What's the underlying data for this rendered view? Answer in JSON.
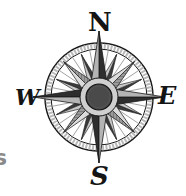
{
  "image": {
    "subject": "compass-rose",
    "labels": {
      "north": "N",
      "south": "S",
      "west": "W",
      "east": "E"
    },
    "partial_text": "s",
    "colors": {
      "ink": "#141414",
      "dark_point": "#3a3a3a",
      "mid_point": "#8c8c8c",
      "light_point": "#d2d2d2",
      "ring": "#b9b9b9",
      "inner_ring": "#cfcfcf",
      "center_disc": "#4a4a4a",
      "partial_text": "#8a8a8a"
    }
  }
}
